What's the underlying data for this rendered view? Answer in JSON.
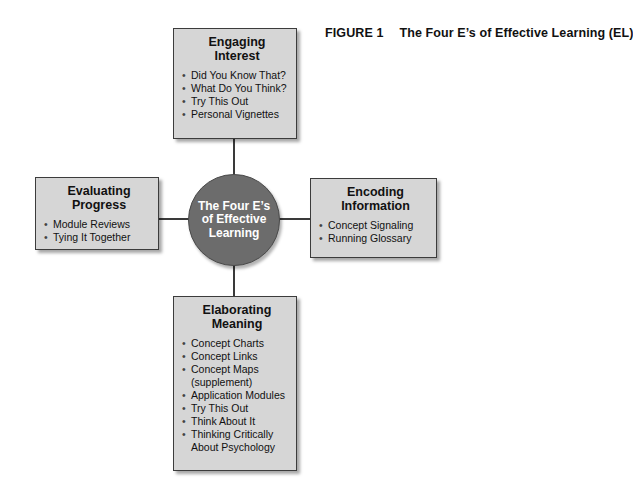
{
  "caption": {
    "figure_label": "FIGURE 1",
    "title": "The Four E’s of Effective Learning (EL)"
  },
  "center": {
    "label": "The Four E’s of Effective Learning",
    "fill_color": "#6c6c6c",
    "text_color": "#ffffff"
  },
  "boxes": {
    "top": {
      "title_line1": "Engaging",
      "title_line2": "Interest",
      "items": [
        "Did You Know That?",
        "What Do You Think?",
        "Try This Out",
        "Personal Vignettes"
      ]
    },
    "left": {
      "title_line1": "Evaluating",
      "title_line2": "Progress",
      "items": [
        "Module Reviews",
        "Tying It Together"
      ]
    },
    "right": {
      "title_line1": "Encoding",
      "title_line2": "Information",
      "items": [
        "Concept Signaling",
        "Running Glossary"
      ]
    },
    "bottom": {
      "title_line1": "Elaborating",
      "title_line2": "Meaning",
      "items": [
        "Concept Charts",
        "Concept Links",
        "Concept Maps",
        "(supplement)",
        "Application Modules",
        "Try This Out",
        "Think About It",
        "Thinking Critically",
        "About Psychology"
      ]
    }
  },
  "colors": {
    "box_fill": "#d6d6d6",
    "box_border": "#3c3c3c",
    "connector": "#3a3a3a"
  }
}
